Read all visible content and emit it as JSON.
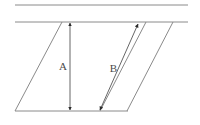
{
  "figure": {
    "background_color": "#ffffff",
    "line_color": "#8a8a8a",
    "arrow_color": "#333333",
    "label_color": "#4a4a4a"
  },
  "labels": {
    "height_label": "A",
    "slant_label": "B"
  },
  "geometry": {
    "top_rail_line": {
      "x1": 15,
      "y1": 5,
      "x2": 188,
      "y2": 5
    },
    "second_rail_line": {
      "x1": 15,
      "y1": 22,
      "x2": 188,
      "y2": 22
    },
    "bottom_base_line": {
      "x1": 15,
      "y1": 111,
      "x2": 128,
      "y2": 111
    },
    "left_slant_line": {
      "x1": 15,
      "y1": 111,
      "x2": 62,
      "y2": 22
    },
    "middle_slant_line": {
      "x1": 100,
      "y1": 111,
      "x2": 146,
      "y2": 22
    },
    "right_slant_line": {
      "x1": 127,
      "y1": 111,
      "x2": 173,
      "y2": 22
    },
    "height_arrow": {
      "x1": 70,
      "y1": 23,
      "x2": 70,
      "y2": 110
    },
    "slant_arrow": {
      "x1": 100,
      "y1": 110,
      "x2": 138,
      "y2": 24
    }
  },
  "label_positions": {
    "height_label": {
      "x": 67,
      "y": 70,
      "anchor": "end"
    },
    "slant_label": {
      "x": 117,
      "y": 72,
      "anchor": "end"
    }
  }
}
